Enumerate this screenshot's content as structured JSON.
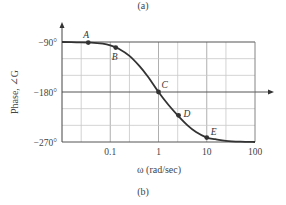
{
  "captions": {
    "top": "(a)",
    "bottom": "(b)"
  },
  "chart_data": {
    "type": "line",
    "title": "",
    "xlabel": "ω (rad/sec)",
    "ylabel": "Phase, ∠G",
    "xscale": "log",
    "xlim": [
      0.01,
      100
    ],
    "ylim": [
      -270,
      -90
    ],
    "x_ticks": [
      {
        "value": 0.1,
        "label": "0.1"
      },
      {
        "value": 1,
        "label": "1"
      },
      {
        "value": 10,
        "label": "10"
      },
      {
        "value": 100,
        "label": "100"
      }
    ],
    "y_ticks": [
      {
        "value": -90,
        "label": "−90°"
      },
      {
        "value": -180,
        "label": "−180°"
      },
      {
        "value": -270,
        "label": "−270°"
      }
    ],
    "grid": true,
    "series": [
      {
        "name": "Phase",
        "x": [
          0.01,
          0.02,
          0.04,
          0.07,
          0.1,
          0.15,
          0.25,
          0.4,
          0.6,
          1,
          1.6,
          2.5,
          4,
          6,
          10,
          15,
          25,
          50,
          100
        ],
        "values": [
          -90,
          -90.5,
          -91,
          -93,
          -96,
          -102,
          -115,
          -133,
          -152,
          -180,
          -203,
          -222,
          -240,
          -252,
          -262,
          -265,
          -268,
          -269.5,
          -270
        ]
      }
    ],
    "annotations": [
      {
        "label": "A",
        "x": 0.035,
        "y": -91
      },
      {
        "label": "B",
        "x": 0.13,
        "y": -100
      },
      {
        "label": "C",
        "x": 1,
        "y": -180
      },
      {
        "label": "D",
        "x": 2.6,
        "y": -222
      },
      {
        "label": "E",
        "x": 10,
        "y": -262
      }
    ]
  }
}
